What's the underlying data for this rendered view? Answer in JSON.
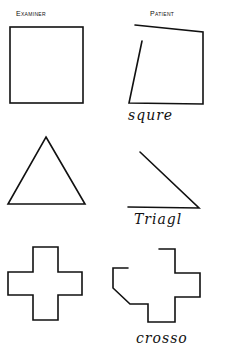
{
  "headers": {
    "examiner": "Examiner",
    "patient": "Patient"
  },
  "rows": [
    {
      "shape": "square",
      "examiner": "square",
      "patient_label": "squre"
    },
    {
      "shape": "triangle",
      "examiner": "triangle",
      "patient_label": "Triagl"
    },
    {
      "shape": "cross",
      "examiner": "cross",
      "patient_label": "crosso"
    }
  ],
  "colors": {
    "ink": "#111111",
    "paper": "#ffffff"
  }
}
